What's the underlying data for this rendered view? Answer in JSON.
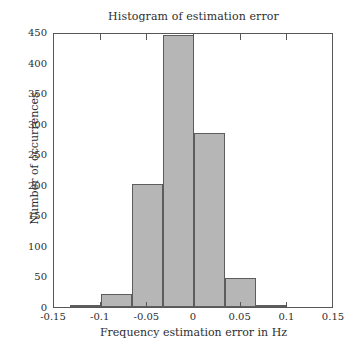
{
  "chart_data": {
    "type": "bar",
    "title": "Histogram of estimation error",
    "xlabel": "Frequency estimation error in Hz",
    "ylabel": "Number of occurrences",
    "xlim": [
      -0.15,
      0.15
    ],
    "ylim": [
      0,
      450
    ],
    "grid": false,
    "legend": null,
    "bin_width": 0.0333,
    "xticks": [
      -0.15,
      -0.1,
      -0.05,
      0,
      0.05,
      0.1,
      0.15
    ],
    "xtick_labels": [
      "-0.15",
      "-0.1",
      "-0.05",
      "0",
      "0.05",
      "0.1",
      "0.15"
    ],
    "yticks": [
      0,
      50,
      100,
      150,
      200,
      250,
      300,
      350,
      400,
      450
    ],
    "ytick_labels": [
      "0",
      "50",
      "100",
      "150",
      "200",
      "250",
      "300",
      "350",
      "400",
      "450"
    ],
    "bar_color": "#b6b6b6",
    "bar_edge_color": "#5d5d5d",
    "bins": [
      {
        "left": -0.1333,
        "right": -0.1,
        "center": -0.1167,
        "value": 2
      },
      {
        "left": -0.1,
        "right": -0.0667,
        "center": -0.0833,
        "value": 22
      },
      {
        "left": -0.0667,
        "right": -0.0333,
        "center": -0.05,
        "value": 202
      },
      {
        "left": -0.0333,
        "right": 0.0,
        "center": -0.0167,
        "value": 445
      },
      {
        "left": 0.0,
        "right": 0.0333,
        "center": 0.0167,
        "value": 285
      },
      {
        "left": 0.0333,
        "right": 0.0667,
        "center": 0.05,
        "value": 48
      },
      {
        "left": 0.0667,
        "right": 0.1,
        "center": 0.0833,
        "value": 3
      }
    ],
    "categories": [
      "-0.117",
      "-0.083",
      "-0.050",
      "-0.017",
      "0.017",
      "0.050",
      "0.083"
    ],
    "values": [
      2,
      22,
      202,
      445,
      285,
      48,
      3
    ]
  }
}
